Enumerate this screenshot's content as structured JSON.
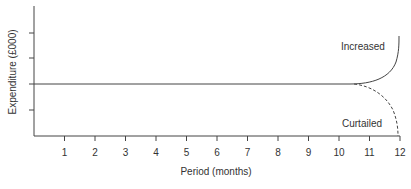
{
  "chart_data": {
    "type": "line",
    "title": "",
    "xlabel": "Period (months)",
    "ylabel": "Expenditure (£000)",
    "x_ticks": [
      "1",
      "2",
      "3",
      "4",
      "5",
      "6",
      "7",
      "8",
      "9",
      "10",
      "11",
      "12"
    ],
    "xlim": [
      0,
      12
    ],
    "y_ticks_count": 4,
    "y_tick_labels": [],
    "grid": false,
    "legend": "none (inline annotations)",
    "baseline": "flat expenditure level from month 0 to ~10.5",
    "series": [
      {
        "name": "Increased",
        "style": "solid",
        "x": [
          0,
          10.5,
          11,
          11.5,
          12
        ],
        "y_relative": [
          0,
          0,
          0.1,
          0.5,
          1.85
        ],
        "description": "flat then rises sharply toward month 12"
      },
      {
        "name": "Curtailed",
        "style": "dashed",
        "x": [
          10.5,
          11,
          11.5,
          12
        ],
        "y_relative": [
          0,
          -0.25,
          -0.8,
          -2.0
        ],
        "description": "branches off at ~10.5 months and falls toward zero by month 12"
      }
    ],
    "annotations": [
      "Increased",
      "Curtailed"
    ]
  },
  "labels": {
    "ylabel": "Expenditure (£000)",
    "xlabel": "Period (months)",
    "increased": "Increased",
    "curtailed": "Curtailed",
    "x_ticks": [
      "1",
      "2",
      "3",
      "4",
      "5",
      "6",
      "7",
      "8",
      "9",
      "10",
      "11",
      "12"
    ]
  }
}
